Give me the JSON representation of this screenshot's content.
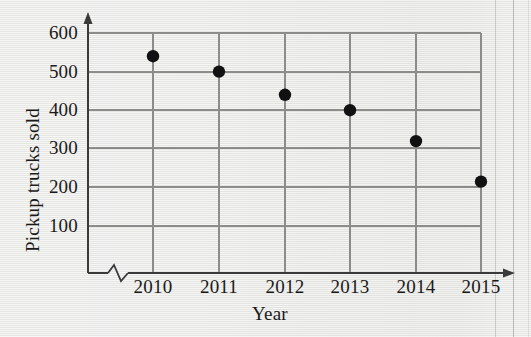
{
  "chart_data": {
    "type": "scatter",
    "title": "",
    "xlabel": "Year",
    "ylabel": "Pickup trucks sold",
    "categories": [
      "2010",
      "2011",
      "2012",
      "2013",
      "2014",
      "2015"
    ],
    "x": [
      2010,
      2011,
      2012,
      2013,
      2014,
      2015
    ],
    "values": [
      540,
      500,
      440,
      400,
      320,
      215
    ],
    "series": [
      {
        "name": "Pickup trucks sold",
        "values": [
          540,
          500,
          440,
          400,
          320,
          215
        ]
      }
    ],
    "xtick_labels": [
      "2010",
      "2011",
      "2012",
      "2013",
      "2014",
      "2015"
    ],
    "ytick_labels": [
      "100",
      "200",
      "300",
      "400",
      "500",
      "600"
    ],
    "ytick_values": [
      100,
      200,
      300,
      400,
      500,
      600
    ],
    "ylim": [
      0,
      640
    ],
    "xlim": [
      2009.4,
      2015.6
    ],
    "grid": "both",
    "legend": "none",
    "axis_break": "x-axis zigzag between origin and 2010",
    "marker": "filled-circle",
    "marker_color": "#111111",
    "grid_color": "#8c8c8a",
    "axis_color": "#3a3a3a",
    "background_color": "#e9e9e7",
    "annotations": []
  },
  "axes": {
    "y_title": "Pickup trucks sold",
    "x_title": "Year"
  }
}
